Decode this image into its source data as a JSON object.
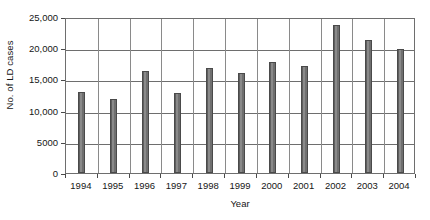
{
  "chart_data": {
    "type": "bar",
    "title": "",
    "subtitle": "",
    "xlabel": "Year",
    "ylabel": "No. of LD cases",
    "categories": [
      "1994",
      "1995",
      "1996",
      "1997",
      "1998",
      "1999",
      "2000",
      "2001",
      "2002",
      "2003",
      "2004"
    ],
    "values": [
      13000,
      11800,
      16300,
      12800,
      16800,
      16100,
      17800,
      17200,
      23800,
      21300,
      19900
    ],
    "series": [
      {
        "name": "No. of LD cases",
        "values": [
          13000,
          11800,
          16300,
          12800,
          16800,
          16100,
          17800,
          17200,
          23800,
          21300,
          19900
        ]
      }
    ],
    "ylim": [
      0,
      25000
    ],
    "ytick_values": [
      0,
      5000,
      10000,
      15000,
      20000,
      25000
    ],
    "ytick_labels": [
      "0",
      "5000",
      "10,000",
      "15,000",
      "20,000",
      "25,000"
    ],
    "grid": "horizontal-and-category-vertical",
    "legend": "none",
    "bar_color": "#737373",
    "bar_edge_color": "#4a4a4a",
    "gridline_color": "#6e6e6e",
    "axis_color": "#4a4a4a",
    "background_color": "#ffffff",
    "text_color": "#161616",
    "annotations": []
  }
}
